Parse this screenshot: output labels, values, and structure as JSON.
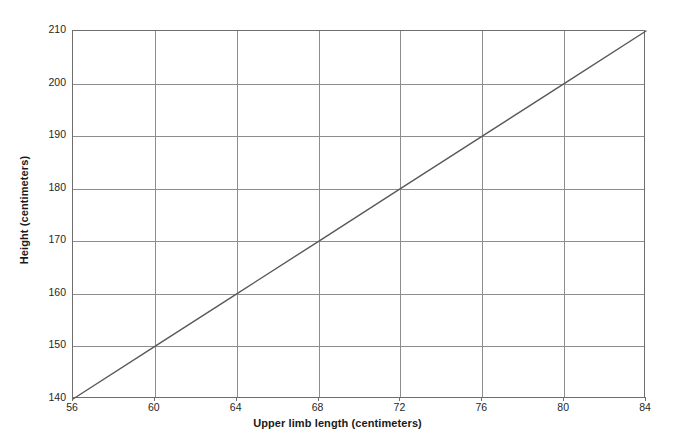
{
  "chart_data": {
    "type": "line",
    "title": "",
    "subtitle": "",
    "xlabel": "Upper limb length (centimeters)",
    "ylabel": "Height (centimeters)",
    "xlim": [
      56,
      84
    ],
    "ylim": [
      140,
      210
    ],
    "xticks": [
      56,
      60,
      64,
      68,
      72,
      76,
      80,
      84
    ],
    "yticks": [
      140,
      150,
      160,
      170,
      180,
      190,
      200,
      210
    ],
    "xtick_labels": [
      "56",
      "60",
      "64",
      "68",
      "72",
      "76",
      "80",
      "84"
    ],
    "ytick_labels": [
      "140",
      "150",
      "160",
      "170",
      "180",
      "190",
      "200",
      "210"
    ],
    "grid": true,
    "legend": null,
    "legend_position": "none",
    "annotations": [],
    "series": [
      {
        "name": "height vs upper limb length",
        "type": "line",
        "color": "#595959",
        "linewidth": 1.4,
        "markers": false,
        "x": [
          56,
          60,
          64,
          68,
          72,
          76,
          80,
          84
        ],
        "y": [
          140,
          150,
          160,
          170,
          180,
          190,
          200,
          210
        ]
      }
    ]
  },
  "axes": {
    "x": {
      "title": "Upper limb length (centimeters)",
      "ticks": [
        {
          "value": 56,
          "label": "56"
        },
        {
          "value": 60,
          "label": "60"
        },
        {
          "value": 64,
          "label": "64"
        },
        {
          "value": 68,
          "label": "68"
        },
        {
          "value": 72,
          "label": "72"
        },
        {
          "value": 76,
          "label": "76"
        },
        {
          "value": 80,
          "label": "80"
        },
        {
          "value": 84,
          "label": "84"
        }
      ]
    },
    "y": {
      "title": "Height (centimeters)",
      "ticks": [
        {
          "value": 210,
          "label": "210"
        },
        {
          "value": 200,
          "label": "200"
        },
        {
          "value": 190,
          "label": "190"
        },
        {
          "value": 180,
          "label": "180"
        },
        {
          "value": 170,
          "label": "170"
        },
        {
          "value": 160,
          "label": "160"
        },
        {
          "value": 150,
          "label": "150"
        },
        {
          "value": 140,
          "label": "140"
        }
      ]
    }
  },
  "style": {
    "background": "#ffffff",
    "frame_color": "#6e6e6e",
    "grid_color": "#8d8d8d",
    "line_color": "#595959",
    "text_color": "#1a1a1a"
  }
}
